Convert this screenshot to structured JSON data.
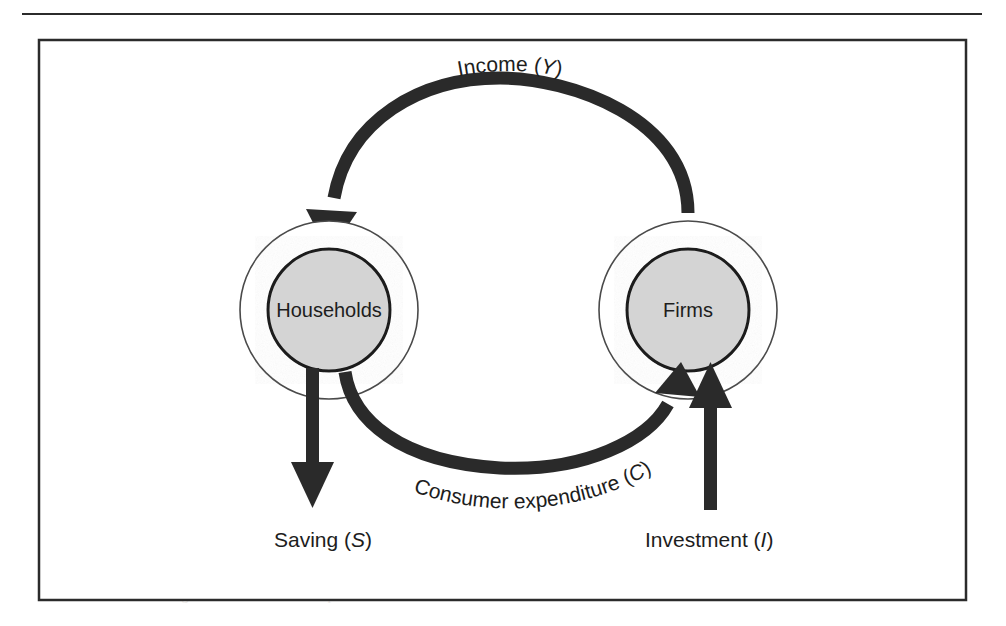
{
  "figure": {
    "kind": "circular-flow-of-income-diagram",
    "frame": {
      "border_color": "#2b2b2b",
      "background": "#ffffff"
    },
    "page_rule": true
  },
  "nodes": [
    {
      "id": "households",
      "label": "Households",
      "cx": 329,
      "cy": 310,
      "inner_r": 61,
      "outer_r": 89,
      "fill": "#d4d4d4",
      "stroke": "#1a1a1a"
    },
    {
      "id": "firms",
      "label": "Firms",
      "cx": 688,
      "cy": 310,
      "inner_r": 61,
      "outer_r": 89,
      "fill": "#d4d4d4",
      "stroke": "#1a1a1a"
    }
  ],
  "flows": [
    {
      "id": "income",
      "label_plain": "Income",
      "symbol": "Y",
      "label_full": "Income (Y)",
      "from": "firms",
      "to": "households",
      "shape": "arc-top",
      "color": "#2a2a2a"
    },
    {
      "id": "consumer-expenditure",
      "label_plain": "Consumer expenditure",
      "symbol": "C",
      "label_full": "Consumer expenditure (C)",
      "from": "households",
      "to": "firms",
      "shape": "arc-bottom",
      "color": "#2a2a2a"
    },
    {
      "id": "saving",
      "label_plain": "Saving",
      "symbol": "S",
      "label_full": "Saving (S)",
      "from": "households",
      "to": "outside",
      "shape": "straight-down",
      "color": "#2a2a2a"
    },
    {
      "id": "investment",
      "label_plain": "Investment",
      "symbol": "I",
      "label_full": "Investment (I)",
      "from": "outside",
      "to": "firms",
      "shape": "straight-up",
      "color": "#2a2a2a"
    }
  ],
  "arc_labels": {
    "income": {
      "x": 510,
      "y": 98
    },
    "consumer_expenditure": {
      "x": 512,
      "y": 494
    }
  },
  "bottom_labels": {
    "saving": {
      "text": "Saving (S)",
      "plain": "Saving",
      "symbol": "S",
      "x": 274,
      "y": 540
    },
    "investment": {
      "text": "Investment (I)",
      "plain": "Investment",
      "symbol": "I",
      "x": 645,
      "y": 540
    }
  },
  "bleed_text": [
    "and the accompanying text",
    "the circular flow diagram shows how income passes"
  ]
}
